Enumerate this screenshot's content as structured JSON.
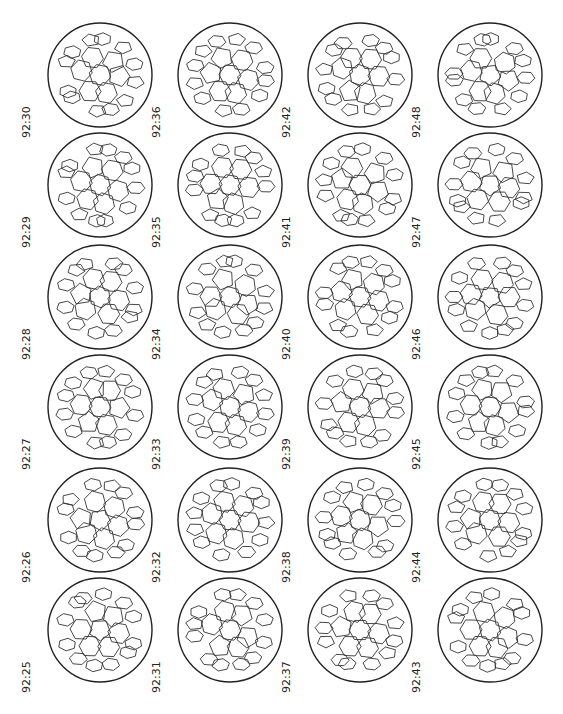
{
  "figure": {
    "columns": [
      [
        "92:30",
        "92:29",
        "92:28",
        "92:27",
        "92:26",
        "92:25"
      ],
      [
        "92:36",
        "92:35",
        "92:34",
        "92:33",
        "92:32",
        "92:31"
      ],
      [
        "92:42",
        "92:41",
        "92:40",
        "92:39",
        "92:38",
        "92:37"
      ],
      [
        "92:48",
        "92:47",
        "92:46",
        "92:45",
        "92:44",
        "92:43"
      ]
    ]
  }
}
